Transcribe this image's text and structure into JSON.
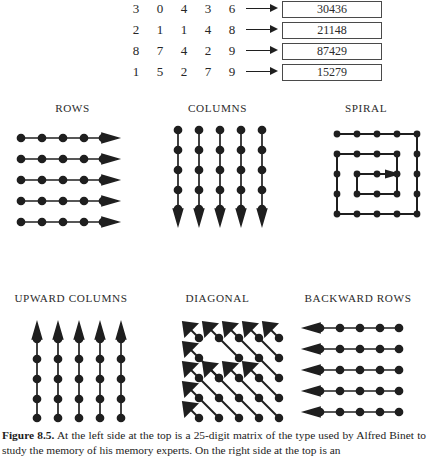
{
  "figure": {
    "number_label": "Figure 8.5.",
    "caption_text": " At the left side at the top is a 25-digit matrix of the type used by Alfred Binet to study the memory of his memory experts. On the right side at the top is an"
  },
  "matrix": {
    "rows": [
      {
        "digits": [
          "3",
          "0",
          "4",
          "3",
          "6"
        ],
        "boxed_number": "30436",
        "arrow_icon": "arrow-right-icon"
      },
      {
        "digits": [
          "2",
          "1",
          "1",
          "4",
          "8"
        ],
        "boxed_number": "21148",
        "arrow_icon": "arrow-right-icon"
      },
      {
        "digits": [
          "8",
          "7",
          "4",
          "2",
          "9"
        ],
        "boxed_number": "87429",
        "arrow_icon": "arrow-right-icon"
      },
      {
        "digits": [
          "1",
          "5",
          "2",
          "7",
          "9"
        ],
        "boxed_number": "15279",
        "arrow_icon": "arrow-right-icon"
      }
    ]
  },
  "diagrams": [
    {
      "label": "ROWS",
      "pattern": "rows-right",
      "arrow_direction": "right",
      "lines": 5,
      "dots_per_line": 5
    },
    {
      "label": "COLUMNS",
      "pattern": "columns-down",
      "arrow_direction": "down",
      "lines": 5,
      "dots_per_line": 5
    },
    {
      "label": "SPIRAL",
      "pattern": "spiral-inward",
      "arrow_direction": "right",
      "lines": 1,
      "dots_per_line": 25
    },
    {
      "label": "UPWARD COLUMNS",
      "pattern": "columns-up",
      "arrow_direction": "up",
      "lines": 5,
      "dots_per_line": 5
    },
    {
      "label": "DIAGONAL",
      "pattern": "diagonals-upleft",
      "arrow_direction": "up-left",
      "lines": 9,
      "dots_per_line": 5
    },
    {
      "label": "BACKWARD ROWS",
      "pattern": "rows-left",
      "arrow_direction": "left",
      "lines": 5,
      "dots_per_line": 5
    }
  ],
  "colors": {
    "ink": "#1f1f1f",
    "text": "#262626",
    "box_border": "#4a4a4a",
    "background": "#ffffff"
  }
}
